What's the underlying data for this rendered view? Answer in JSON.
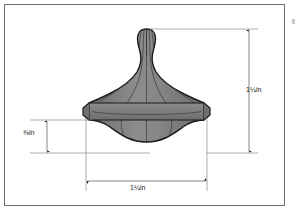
{
  "figure": {
    "kind": "dimensioned-technical-drawing",
    "frame": {
      "border_color": "#6e6e6e",
      "background_color": "#ffffff"
    },
    "object_colors": {
      "body_fill": "#7f7f7f",
      "body_fill_light": "#8c8c8c",
      "body_fill_dark": "#6b6b6b",
      "outline": "#1a1a1a",
      "contour_line": "#3a3a3a"
    },
    "annotation_colors": {
      "dimension_line": "#555555",
      "extension_line": "#8a8a8a",
      "arrow": "#1b1b1b",
      "text": "#1b1b1b"
    }
  },
  "dimensions": [
    {
      "id": "overall-height",
      "label": "1¼in",
      "orientation": "vertical",
      "position": "right",
      "measures": "overall height from top of knob to bottom of dome"
    },
    {
      "id": "overall-width",
      "label": "1¼in",
      "orientation": "horizontal",
      "position": "bottom",
      "measures": "overall width across the flange rim"
    },
    {
      "id": "rim-to-bottom-height",
      "label": "⅜in",
      "orientation": "vertical",
      "position": "left",
      "measures": "height from flange rim underside to bottom of dome"
    }
  ],
  "edge_mark": {
    "name": "page-edge-mark",
    "color": "#c9c9c9"
  }
}
